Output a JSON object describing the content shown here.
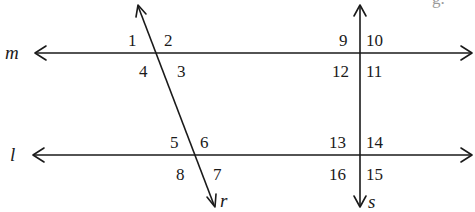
{
  "diagram": {
    "type": "parallel lines cut by transversals",
    "partial_top_text": "g.",
    "lines": {
      "m": {
        "label": "m",
        "kind": "horizontal",
        "y": 53,
        "x1": 10,
        "x2": 472,
        "arrows": "left"
      },
      "l": {
        "label": "l",
        "kind": "horizontal",
        "y": 155,
        "x1": 10,
        "x2": 472,
        "arrows": "both"
      },
      "r": {
        "label": "r",
        "kind": "transversal",
        "x1": 138,
        "y1": 5,
        "x2": 215,
        "y2": 207,
        "arrows": "both"
      },
      "s": {
        "label": "s",
        "kind": "transversal",
        "x1": 360,
        "y1": 5,
        "x2": 360,
        "y2": 207,
        "arrows": "both"
      }
    },
    "angles": [
      {
        "id": "1",
        "label": "1"
      },
      {
        "id": "2",
        "label": "2"
      },
      {
        "id": "3",
        "label": "3"
      },
      {
        "id": "4",
        "label": "4"
      },
      {
        "id": "5",
        "label": "5"
      },
      {
        "id": "6",
        "label": "6"
      },
      {
        "id": "7",
        "label": "7"
      },
      {
        "id": "8",
        "label": "8"
      },
      {
        "id": "9",
        "label": "9"
      },
      {
        "id": "10",
        "label": "10"
      },
      {
        "id": "11",
        "label": "11"
      },
      {
        "id": "12",
        "label": "12"
      },
      {
        "id": "13",
        "label": "13"
      },
      {
        "id": "14",
        "label": "14"
      },
      {
        "id": "15",
        "label": "15"
      },
      {
        "id": "16",
        "label": "16"
      }
    ]
  }
}
